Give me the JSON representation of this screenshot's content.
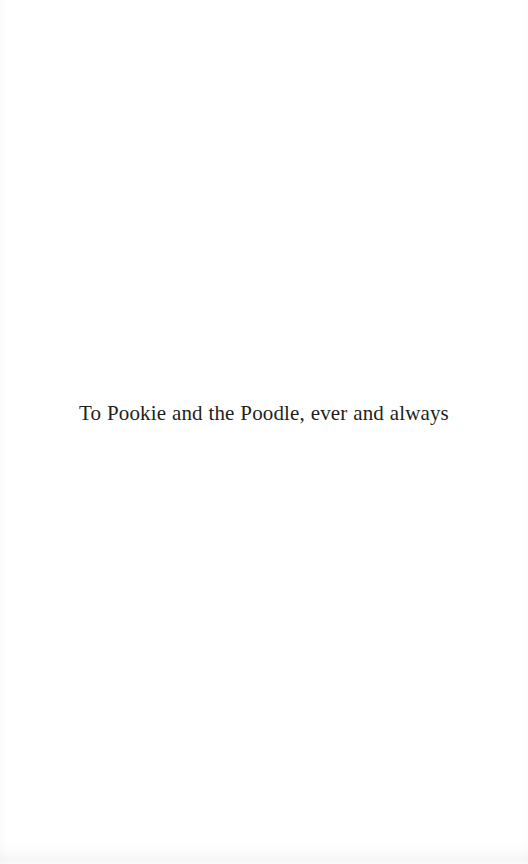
{
  "page": {
    "kind": "book-dedication-page",
    "background_color": "#ffffff",
    "ink_color": "#231f20",
    "width": 528,
    "height": 864
  },
  "dedication": {
    "text": "To Pookie and the Poodle, ever and always"
  }
}
